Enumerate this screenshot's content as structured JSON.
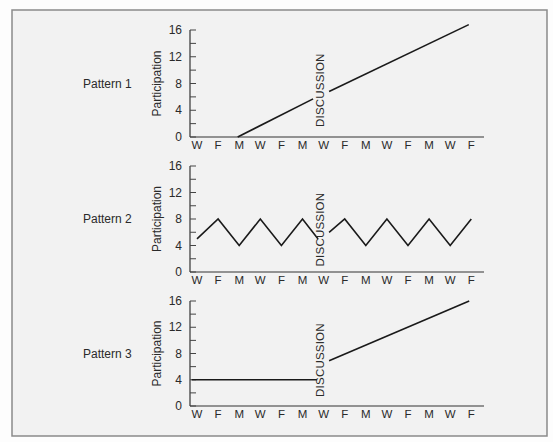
{
  "figure": {
    "background": "#f2f2f2",
    "border_color": "#8a8a8a",
    "line_color": "#1a1a1a"
  },
  "chart_data": [
    {
      "type": "line",
      "title": "Pattern 1",
      "xlabel": "",
      "ylabel": "Participation",
      "ylim": [
        0,
        16
      ],
      "yticks": [
        0,
        4,
        8,
        12,
        16
      ],
      "ytick_labels": [
        "0",
        "4",
        "8",
        "12",
        "16"
      ],
      "minor_ytick_step": 2,
      "categories": [
        "W",
        "F",
        "M",
        "W",
        "F",
        "M",
        "W",
        "F",
        "M",
        "W",
        "F",
        "M",
        "W",
        "F"
      ],
      "grid": false,
      "legend": null,
      "annotation": {
        "text": "DISCUSSION",
        "x_index": 6,
        "y_value": 7,
        "rotation": -90
      },
      "series": [
        {
          "name": "Participation",
          "segments": [
            [
              [
                1.93,
                0
              ],
              [
                5.5,
                5.7
              ]
            ],
            [
              [
                6.26,
                6.8
              ],
              [
                12.88,
                16.8
              ]
            ]
          ]
        }
      ]
    },
    {
      "type": "line",
      "title": "Pattern 2",
      "xlabel": "",
      "ylabel": "Participation",
      "ylim": [
        0,
        16
      ],
      "yticks": [
        0,
        4,
        8,
        12,
        16
      ],
      "ytick_labels": [
        "0",
        "4",
        "8",
        "12",
        "16"
      ],
      "minor_ytick_step": 2,
      "categories": [
        "W",
        "F",
        "M",
        "W",
        "F",
        "M",
        "W",
        "F",
        "M",
        "W",
        "F",
        "M",
        "W",
        "F"
      ],
      "grid": false,
      "legend": null,
      "annotation": {
        "text": "DISCUSSION",
        "x_index": 6,
        "y_value": 6.4,
        "rotation": -90
      },
      "series": [
        {
          "name": "Participation",
          "segments": [
            [
              [
                0,
                5
              ],
              [
                1,
                8
              ],
              [
                2,
                4
              ],
              [
                3,
                8
              ],
              [
                4,
                4
              ],
              [
                5,
                8
              ],
              [
                5.74,
                5
              ]
            ],
            [
              [
                6.26,
                6
              ],
              [
                7,
                8
              ],
              [
                8,
                4
              ],
              [
                9,
                8
              ],
              [
                10,
                4
              ],
              [
                11,
                8
              ],
              [
                12,
                4
              ],
              [
                13,
                8
              ]
            ]
          ]
        }
      ]
    },
    {
      "type": "line",
      "title": "Pattern 3",
      "xlabel": "",
      "ylabel": "Participation",
      "ylim": [
        0,
        16
      ],
      "yticks": [
        0,
        4,
        8,
        12,
        16
      ],
      "ytick_labels": [
        "0",
        "4",
        "8",
        "12",
        "16"
      ],
      "minor_ytick_step": 2,
      "categories": [
        "W",
        "F",
        "M",
        "W",
        "F",
        "M",
        "W",
        "F",
        "M",
        "W",
        "F",
        "M",
        "W",
        "F"
      ],
      "grid": false,
      "legend": null,
      "annotation": {
        "text": "DISCUSSION",
        "x_index": 6,
        "y_value": 7,
        "rotation": -90
      },
      "series": [
        {
          "name": "Participation",
          "segments": [
            [
              [
                -0.25,
                4
              ],
              [
                5.69,
                4
              ]
            ],
            [
              [
                6.26,
                6.9
              ],
              [
                12.9,
                16
              ]
            ]
          ]
        }
      ]
    }
  ]
}
